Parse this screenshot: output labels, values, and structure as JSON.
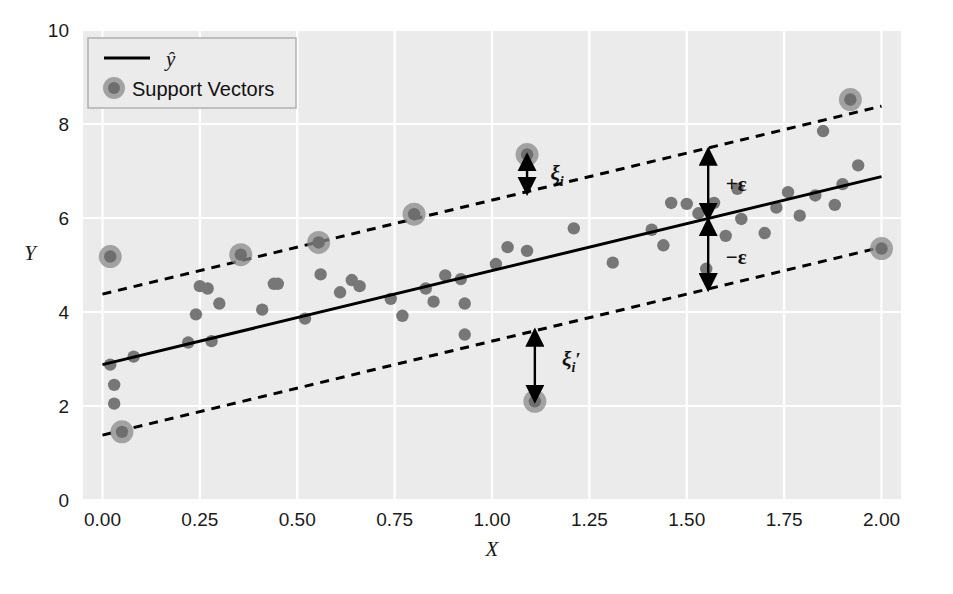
{
  "chart_data": {
    "type": "scatter",
    "title": "",
    "xlabel": "X",
    "ylabel": "Y",
    "xlim": [
      -0.05,
      2.05
    ],
    "ylim": [
      0,
      10
    ],
    "xticks": [
      "0.00",
      "0.25",
      "0.50",
      "0.75",
      "1.00",
      "1.25",
      "1.50",
      "1.75",
      "2.00"
    ],
    "xtick_values": [
      0.0,
      0.25,
      0.5,
      0.75,
      1.0,
      1.25,
      1.5,
      1.75,
      2.0
    ],
    "yticks": [
      "0",
      "2",
      "4",
      "6",
      "8",
      "10"
    ],
    "ytick_values": [
      0,
      2,
      4,
      6,
      8,
      10
    ],
    "grid": true,
    "grid_color": "#ffffff",
    "panel_color": "#ebebeb",
    "point_color": "#777777",
    "support_vector_color": "#8a8a8a",
    "line_color": "#000000",
    "legend_position": "top-left",
    "legend": [
      {
        "label": "ŷ",
        "marker": "line"
      },
      {
        "label": "Support Vectors",
        "marker": "circle"
      }
    ],
    "fit_line": {
      "name": "y-hat",
      "style": "solid",
      "slope": 2.0,
      "intercept": 2.88,
      "x0": 0.0,
      "y0": 2.88,
      "x1": 2.0,
      "y1": 6.88
    },
    "upper_margin_line": {
      "name": "+epsilon boundary",
      "style": "dashed",
      "x0": 0.0,
      "y0": 4.38,
      "x1": 2.0,
      "y1": 8.38
    },
    "lower_margin_line": {
      "name": "-epsilon boundary",
      "style": "dashed",
      "x0": 0.0,
      "y0": 1.38,
      "x1": 2.0,
      "y1": 5.38
    },
    "epsilon": 1.5,
    "annotations": [
      {
        "name": "xi",
        "text": "ξ",
        "sub": "i",
        "prime": false,
        "x": 1.09,
        "y_top": 7.35,
        "y_bot": 6.52,
        "label_x": 1.15,
        "label_y": 6.95
      },
      {
        "name": "xi-prime",
        "text": "ξ",
        "sub": "i",
        "prime": true,
        "x": 1.11,
        "y_top": 3.62,
        "y_bot": 2.1,
        "label_x": 1.18,
        "label_y": 3.0
      },
      {
        "name": "plus-epsilon",
        "text": "+ε",
        "x": 1.555,
        "y_top": 7.47,
        "y_bot": 5.97,
        "label_x": 1.6,
        "label_y": 6.72
      },
      {
        "name": "minus-epsilon",
        "text": "−ε",
        "x": 1.555,
        "y_top": 5.97,
        "y_bot": 4.47,
        "label_x": 1.6,
        "label_y": 5.16
      }
    ],
    "points": [
      {
        "x": 0.02,
        "y": 2.88
      },
      {
        "x": 0.03,
        "y": 2.45
      },
      {
        "x": 0.03,
        "y": 2.05
      },
      {
        "x": 0.08,
        "y": 3.05
      },
      {
        "x": 0.22,
        "y": 3.35
      },
      {
        "x": 0.25,
        "y": 4.55
      },
      {
        "x": 0.27,
        "y": 4.5
      },
      {
        "x": 0.24,
        "y": 3.95
      },
      {
        "x": 0.28,
        "y": 3.38
      },
      {
        "x": 0.3,
        "y": 4.18
      },
      {
        "x": 0.41,
        "y": 4.05
      },
      {
        "x": 0.44,
        "y": 4.6
      },
      {
        "x": 0.45,
        "y": 4.6
      },
      {
        "x": 0.52,
        "y": 3.86
      },
      {
        "x": 0.56,
        "y": 4.8
      },
      {
        "x": 0.61,
        "y": 4.42
      },
      {
        "x": 0.64,
        "y": 4.68
      },
      {
        "x": 0.66,
        "y": 4.55
      },
      {
        "x": 0.74,
        "y": 4.28
      },
      {
        "x": 0.77,
        "y": 3.92
      },
      {
        "x": 0.83,
        "y": 4.5
      },
      {
        "x": 0.85,
        "y": 4.22
      },
      {
        "x": 0.88,
        "y": 4.78
      },
      {
        "x": 0.92,
        "y": 4.7
      },
      {
        "x": 0.93,
        "y": 4.18
      },
      {
        "x": 0.93,
        "y": 3.52
      },
      {
        "x": 1.01,
        "y": 5.02
      },
      {
        "x": 1.04,
        "y": 5.38
      },
      {
        "x": 1.09,
        "y": 5.3
      },
      {
        "x": 1.21,
        "y": 5.78
      },
      {
        "x": 1.31,
        "y": 5.05
      },
      {
        "x": 1.41,
        "y": 5.75
      },
      {
        "x": 1.44,
        "y": 5.42
      },
      {
        "x": 1.46,
        "y": 6.32
      },
      {
        "x": 1.5,
        "y": 6.3
      },
      {
        "x": 1.53,
        "y": 6.1
      },
      {
        "x": 1.55,
        "y": 4.92
      },
      {
        "x": 1.57,
        "y": 6.32
      },
      {
        "x": 1.6,
        "y": 5.62
      },
      {
        "x": 1.63,
        "y": 6.62
      },
      {
        "x": 1.64,
        "y": 5.98
      },
      {
        "x": 1.7,
        "y": 5.68
      },
      {
        "x": 1.73,
        "y": 6.22
      },
      {
        "x": 1.76,
        "y": 6.55
      },
      {
        "x": 1.79,
        "y": 6.05
      },
      {
        "x": 1.83,
        "y": 6.48
      },
      {
        "x": 1.85,
        "y": 7.85
      },
      {
        "x": 1.88,
        "y": 6.28
      },
      {
        "x": 1.9,
        "y": 6.72
      },
      {
        "x": 1.94,
        "y": 7.12
      }
    ],
    "support_vectors": [
      {
        "x": 0.02,
        "y": 5.18
      },
      {
        "x": 0.05,
        "y": 1.45
      },
      {
        "x": 0.355,
        "y": 5.22
      },
      {
        "x": 0.555,
        "y": 5.48
      },
      {
        "x": 0.8,
        "y": 6.08
      },
      {
        "x": 1.09,
        "y": 7.35
      },
      {
        "x": 1.11,
        "y": 2.1
      },
      {
        "x": 1.92,
        "y": 8.52
      },
      {
        "x": 2.0,
        "y": 5.35
      }
    ]
  }
}
